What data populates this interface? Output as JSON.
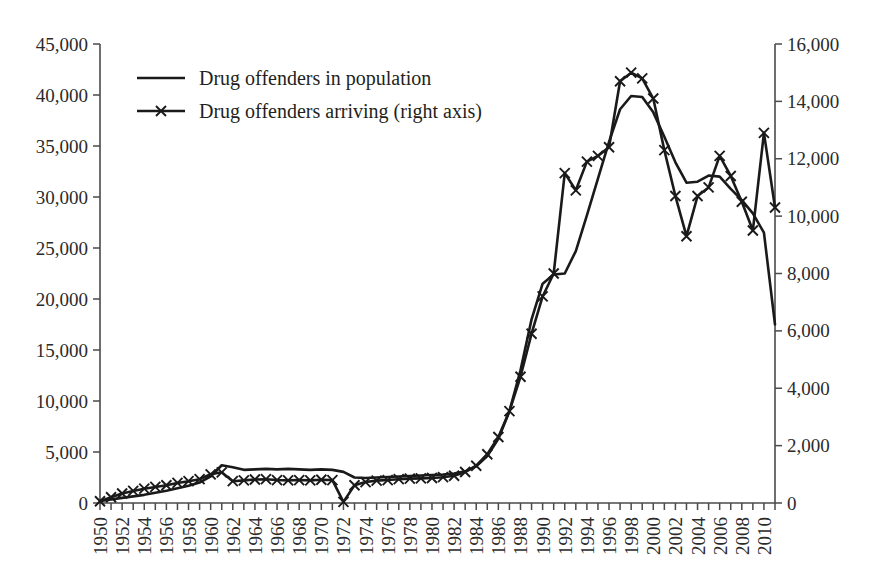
{
  "chart_data": {
    "type": "line",
    "title": "",
    "xlabel": "",
    "ylabel": "",
    "grid": false,
    "legend_position": "top-left",
    "x": [
      1950,
      1951,
      1952,
      1953,
      1954,
      1955,
      1956,
      1957,
      1958,
      1959,
      1960,
      1961,
      1962,
      1963,
      1964,
      1965,
      1966,
      1967,
      1968,
      1969,
      1970,
      1971,
      1972,
      1973,
      1974,
      1975,
      1976,
      1977,
      1978,
      1979,
      1980,
      1981,
      1982,
      1983,
      1984,
      1985,
      1986,
      1987,
      1988,
      1989,
      1990,
      1991,
      1992,
      1993,
      1994,
      1995,
      1996,
      1997,
      1998,
      1999,
      2000,
      2001,
      2002,
      2003,
      2004,
      2005,
      2006,
      2007,
      2008,
      2009,
      2010,
      2011
    ],
    "xtick_labels": [
      "1950",
      "1952",
      "1954",
      "1956",
      "1958",
      "1960",
      "1962",
      "1964",
      "1966",
      "1968",
      "1970",
      "1972",
      "1974",
      "1976",
      "1978",
      "1980",
      "1982",
      "1984",
      "1986",
      "1988",
      "1990",
      "1992",
      "1994",
      "1996",
      "1998",
      "2000",
      "2002",
      "2004",
      "2006",
      "2008",
      "2010"
    ],
    "left_axis": {
      "label": "Drug offenders in population",
      "ylim": [
        0,
        45000
      ],
      "ticks": [
        0,
        5000,
        10000,
        15000,
        20000,
        25000,
        30000,
        35000,
        40000,
        45000
      ],
      "tick_labels": [
        "0",
        "5,000",
        "10,000",
        "15,000",
        "20,000",
        "25,000",
        "30,000",
        "35,000",
        "40,000",
        "45,000"
      ]
    },
    "right_axis": {
      "label": "Drug offenders arriving (right axis)",
      "ylim": [
        0,
        16000
      ],
      "ticks": [
        0,
        2000,
        4000,
        6000,
        8000,
        10000,
        12000,
        14000,
        16000
      ],
      "tick_labels": [
        "0",
        "2,000",
        "4,000",
        "6,000",
        "8,000",
        "10,000",
        "12,000",
        "14,000",
        "16,000"
      ]
    },
    "series": [
      {
        "name": "Drug offenders in population",
        "axis": "left",
        "marker": "none",
        "color": "#1a1a1a",
        "values": [
          200,
          350,
          500,
          650,
          800,
          1000,
          1200,
          1450,
          1700,
          2000,
          2600,
          3700,
          3500,
          3250,
          3300,
          3350,
          3300,
          3350,
          3300,
          3250,
          3300,
          3250,
          3050,
          2500,
          2450,
          2500,
          2550,
          2600,
          2650,
          2700,
          2750,
          2800,
          2900,
          3100,
          3600,
          4600,
          6300,
          9000,
          13000,
          18000,
          21500,
          22400,
          22500,
          24700,
          28200,
          31800,
          35400,
          38600,
          39900,
          39800,
          38300,
          35900,
          33400,
          31400,
          31500,
          32100,
          32000,
          30800,
          29700,
          28400,
          26500,
          17500
        ]
      },
      {
        "name": "Drug offenders arriving (right axis)",
        "axis": "right",
        "marker": "x",
        "color": "#1a1a1a",
        "values": [
          60,
          200,
          330,
          420,
          500,
          560,
          620,
          700,
          760,
          830,
          1000,
          1070,
          760,
          790,
          820,
          830,
          800,
          790,
          800,
          790,
          810,
          800,
          40,
          620,
          730,
          780,
          800,
          830,
          850,
          860,
          870,
          900,
          950,
          1080,
          1300,
          1700,
          2300,
          3200,
          4400,
          5900,
          7200,
          8000,
          11500,
          10900,
          11900,
          12100,
          12400,
          14700,
          15000,
          14800,
          14100,
          12300,
          10700,
          9300,
          10700,
          11000,
          12100,
          11400,
          10500,
          9500,
          12900,
          10300
        ]
      }
    ]
  },
  "legend": {
    "items": [
      {
        "label": "Drug offenders in population",
        "marker": "none"
      },
      {
        "label": "Drug offenders arriving (right axis)",
        "marker": "x"
      }
    ]
  }
}
